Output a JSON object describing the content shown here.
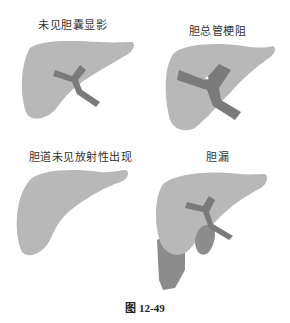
{
  "panels": [
    {
      "id": "no-gallbladder",
      "label": "未见胆囊显影"
    },
    {
      "id": "cbd-obstruction",
      "label": "胆总管梗阻"
    },
    {
      "id": "no-biliary",
      "label": "胆道未见放射性出现"
    },
    {
      "id": "bile-leak",
      "label": "胆漏"
    }
  ],
  "caption": "图 12-49",
  "colors": {
    "liver": "#b8b8b8",
    "duct": "#7a7a7a",
    "leak": "#8c8c8c",
    "text": "#333333"
  }
}
